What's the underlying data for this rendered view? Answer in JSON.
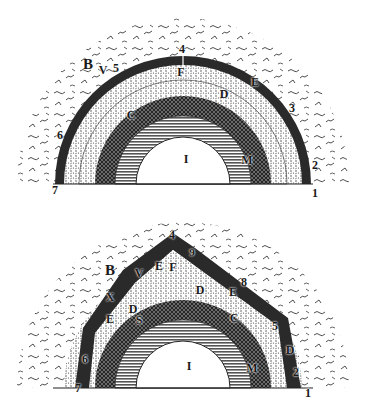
{
  "figures": [
    {
      "id": "top",
      "description": "Cross-section of the Earth, crust intact",
      "center": [
        183,
        184
      ],
      "radii": {
        "air": 166,
        "crust_outer": 128,
        "crust_inner": 119,
        "layer_d": 104,
        "layer_c": 88,
        "layer_m": 68,
        "core_i": 47
      },
      "labels": [
        {
          "text": "B",
          "x": 88,
          "y": 64,
          "size": "big"
        },
        {
          "text": "V",
          "x": 103,
          "y": 70,
          "size": "mid"
        },
        {
          "text": "5",
          "x": 116,
          "y": 68,
          "size": "mid"
        },
        {
          "text": "4",
          "x": 182,
          "y": 49,
          "size": "mid"
        },
        {
          "text": "F",
          "x": 181,
          "y": 72,
          "size": "mid"
        },
        {
          "text": "E",
          "x": 255,
          "y": 82,
          "size": "mid"
        },
        {
          "text": "D",
          "x": 224,
          "y": 94,
          "size": "mid"
        },
        {
          "text": "3",
          "x": 292,
          "y": 108,
          "size": "mid"
        },
        {
          "text": "C",
          "x": 131,
          "y": 115,
          "size": "mid"
        },
        {
          "text": "6",
          "x": 60,
          "y": 135,
          "size": "mid"
        },
        {
          "text": "I",
          "x": 186,
          "y": 159,
          "size": "mid"
        },
        {
          "text": "M",
          "x": 247,
          "y": 160,
          "size": "mid"
        },
        {
          "text": "2",
          "x": 315,
          "y": 165,
          "size": "mid"
        },
        {
          "text": "7",
          "x": 55,
          "y": 190,
          "size": "mid"
        },
        {
          "text": "1",
          "x": 315,
          "y": 193,
          "size": "mid"
        }
      ]
    },
    {
      "id": "bottom",
      "description": "Cross-section of the Earth, crust collapsed",
      "center": [
        183,
        388
      ],
      "radii": {
        "air": 166,
        "crust_outer": 128,
        "crust_inner": 119,
        "layer_d": 104,
        "layer_c": 88,
        "layer_m": 68,
        "core_i": 47
      },
      "labels": [
        {
          "text": "4",
          "x": 172,
          "y": 235,
          "size": "mid"
        },
        {
          "text": "9",
          "x": 192,
          "y": 252,
          "size": "sm"
        },
        {
          "text": "B",
          "x": 110,
          "y": 270,
          "size": "big"
        },
        {
          "text": "V",
          "x": 139,
          "y": 273,
          "size": "mid"
        },
        {
          "text": "E",
          "x": 159,
          "y": 266,
          "size": "mid"
        },
        {
          "text": "F",
          "x": 173,
          "y": 267,
          "size": "mid"
        },
        {
          "text": "8",
          "x": 244,
          "y": 282,
          "size": "mid"
        },
        {
          "text": "X",
          "x": 110,
          "y": 297,
          "size": "mid"
        },
        {
          "text": "D",
          "x": 200,
          "y": 290,
          "size": "mid"
        },
        {
          "text": "E",
          "x": 233,
          "y": 292,
          "size": "mid"
        },
        {
          "text": "D",
          "x": 133,
          "y": 309,
          "size": "mid"
        },
        {
          "text": "E",
          "x": 110,
          "y": 319,
          "size": "mid"
        },
        {
          "text": "S",
          "x": 139,
          "y": 320,
          "size": "mid"
        },
        {
          "text": "C",
          "x": 234,
          "y": 318,
          "size": "mid"
        },
        {
          "text": "5",
          "x": 275,
          "y": 326,
          "size": "mid"
        },
        {
          "text": "D",
          "x": 290,
          "y": 350,
          "size": "mid"
        },
        {
          "text": "6",
          "x": 85,
          "y": 359,
          "size": "mid"
        },
        {
          "text": "I",
          "x": 189,
          "y": 366,
          "size": "mid"
        },
        {
          "text": "M",
          "x": 252,
          "y": 368,
          "size": "mid"
        },
        {
          "text": "2",
          "x": 296,
          "y": 372,
          "size": "mid"
        },
        {
          "text": "7",
          "x": 78,
          "y": 388,
          "size": "mid"
        },
        {
          "text": "1",
          "x": 308,
          "y": 393,
          "size": "mid"
        }
      ]
    }
  ],
  "colors": {
    "ink": "#1a1a1a",
    "crust": "#2a2a2a",
    "hatch": "#555555",
    "paper": "#ffffff",
    "air_stroke": "#3a3a3a"
  }
}
